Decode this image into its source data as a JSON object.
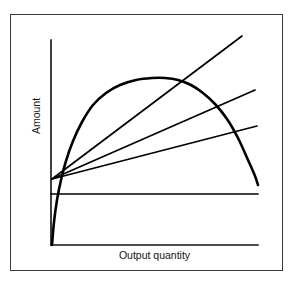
{
  "figure": {
    "background_color": "#ffffff",
    "border_color": "#3a3a3a",
    "ink_color": "#000000"
  },
  "labels": {
    "x_axis": "Output quantity",
    "y_axis": "Amount"
  },
  "chart_data": {
    "type": "line",
    "title": "",
    "subtitle": "",
    "xlabel": "Output quantity",
    "ylabel": "Amount",
    "xlim": [
      0,
      100
    ],
    "ylim": [
      0,
      100
    ],
    "grid": false,
    "legend": "none",
    "axes": {
      "x_axis_pixels": {
        "x1": 51,
        "y1": 245,
        "x2": 258,
        "y2": 245
      },
      "y_axis_pixels": {
        "x1": 51,
        "y1": 40,
        "x2": 51,
        "y2": 245
      },
      "ticks_x": [],
      "ticks_y": []
    },
    "annotations": [
      "Three straight rays emanate from a common point on the vertical axis.",
      "The steepest ray is tangent to the concave curve at the curve's maximum.",
      "A horizontal line lies below the common ray origin."
    ],
    "series": [
      {
        "name": "total-product-curve",
        "type": "curve",
        "shape": "concave quadratic through origin, peak then decline",
        "stroke_width": 2.6,
        "points_pixels": [
          [
            52,
            245
          ],
          [
            54,
            222
          ],
          [
            57,
            200
          ],
          [
            61,
            180
          ],
          [
            66,
            161
          ],
          [
            73,
            141
          ],
          [
            82,
            122
          ],
          [
            93,
            105
          ],
          [
            106,
            93
          ],
          [
            120,
            85
          ],
          [
            136,
            80
          ],
          [
            152,
            78
          ],
          [
            165,
            78
          ],
          [
            178,
            80
          ],
          [
            191,
            85
          ],
          [
            203,
            93
          ],
          [
            215,
            104
          ],
          [
            227,
            119
          ],
          [
            238,
            138
          ],
          [
            248,
            160
          ],
          [
            255,
            176
          ],
          [
            258,
            185
          ]
        ]
      },
      {
        "name": "tangent-ray-steep",
        "type": "ray",
        "stroke_width": 1.7,
        "start_pixels": [
          52,
          179
        ],
        "end_pixels": [
          242,
          36
        ],
        "slope_note": "steepest ray, tangent to curve at its maximum"
      },
      {
        "name": "secant-ray-middle",
        "type": "ray",
        "stroke_width": 1.7,
        "start_pixels": [
          52,
          179
        ],
        "end_pixels": [
          255,
          90
        ],
        "slope_note": "middle slope ray"
      },
      {
        "name": "secant-ray-shallow",
        "type": "ray",
        "stroke_width": 1.7,
        "start_pixels": [
          52,
          179
        ],
        "end_pixels": [
          257,
          126
        ],
        "slope_note": "shallowest sloped ray"
      },
      {
        "name": "horizontal-reference-line",
        "type": "horizontal",
        "stroke_width": 1.7,
        "start_pixels": [
          51,
          194
        ],
        "end_pixels": [
          258,
          194
        ],
        "slope_note": "constant level line"
      }
    ]
  }
}
